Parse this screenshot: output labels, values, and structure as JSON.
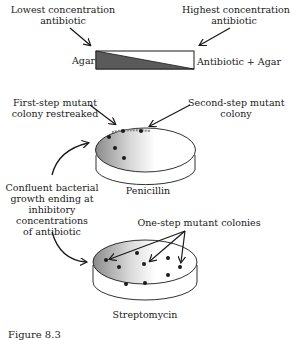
{
  "gradient_plate": {
    "low_label_line1": "Lowest concentration",
    "low_label_line2": "antibiotic",
    "high_label_line1": "Highest concentration",
    "high_label_line2": "antibiotic",
    "left_end_label": "Agar",
    "right_end_label": "Antibiotic + Agar"
  },
  "penicillin_plate": {
    "name": "Penicillin",
    "first_step_label_line1": "First-step mutant",
    "first_step_label_line2": "colony restreaked",
    "second_step_label_line1": "Second-step mutant",
    "second_step_label_line2": "colony",
    "colony_count": 6
  },
  "confluent_label": {
    "line1": "Confluent bacterial",
    "line2": "growth ending at",
    "line3": "inhibitory",
    "line4": "concentrations",
    "line5": "of antibiotic"
  },
  "streptomycin_plate": {
    "name": "Streptomycin",
    "one_step_label": "One-step mutant colonies",
    "colony_count": 9
  },
  "caption": {
    "text": "Figure 8.3"
  },
  "colors": {
    "ink": "#1a1a1a",
    "gradient_fill": "#5a5a5a",
    "plate_shadow": "#9a9a9a"
  }
}
